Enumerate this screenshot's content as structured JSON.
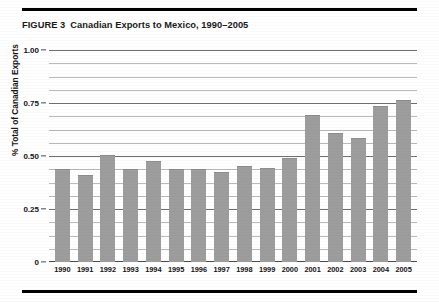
{
  "figure": {
    "label": "FIGURE 3",
    "title": "Canadian Exports to Mexico, 1990–2005"
  },
  "colors": {
    "bar": "#9d9d9d",
    "gridline": "#b9b9b9",
    "gridline_major": "#6f6f6f",
    "axis": "#4a4a4a",
    "rule": "#000000",
    "text": "#141414"
  },
  "chart_data": {
    "type": "bar",
    "title": "Canadian Exports to Mexico, 1990–2005",
    "xlabel": "",
    "ylabel": "% Total of Canadian Exports",
    "categories": [
      "1990",
      "1991",
      "1992",
      "1993",
      "1994",
      "1995",
      "1996",
      "1997",
      "1998",
      "1999",
      "2000",
      "2001",
      "2002",
      "2003",
      "2004",
      "2005"
    ],
    "values": [
      0.44,
      0.41,
      0.505,
      0.44,
      0.475,
      0.44,
      0.44,
      0.425,
      0.455,
      0.445,
      0.49,
      0.695,
      0.61,
      0.585,
      0.735,
      0.765
    ],
    "ylim": [
      0,
      1.0
    ],
    "ytick_labels": [
      "0",
      "0.25",
      "0.50",
      "0.75",
      "1.00"
    ],
    "ytick_values": [
      0,
      0.25,
      0.5,
      0.75,
      1.0
    ],
    "minor_gridline_values": [
      0.0625,
      0.125,
      0.1875,
      0.3125,
      0.375,
      0.4375,
      0.5625,
      0.625,
      0.6875,
      0.8125,
      0.875,
      0.9375
    ],
    "grid": true,
    "legend": "none"
  }
}
